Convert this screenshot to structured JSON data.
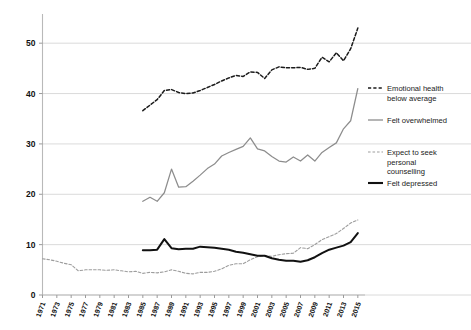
{
  "chart_data": {
    "type": "line",
    "title": "",
    "subtitle": "",
    "xlabel": "",
    "ylabel": "",
    "xlim": [
      1971,
      2016
    ],
    "ylim": [
      0,
      55
    ],
    "yticks": [
      0,
      10,
      20,
      30,
      40,
      50
    ],
    "grid": "horizontal",
    "legend_position": "right",
    "xticks": [
      1971,
      1973,
      1975,
      1977,
      1979,
      1981,
      1983,
      1985,
      1987,
      1989,
      1991,
      1993,
      1995,
      1997,
      1999,
      2001,
      2003,
      2005,
      2007,
      2009,
      2011,
      2013,
      2015
    ],
    "xtick_labels": [
      "1971",
      "1973",
      "1975",
      "1977",
      "1979",
      "1981",
      "1983",
      "1985",
      "1987",
      "1989",
      "1991",
      "1993",
      "1995",
      "1997",
      "1999",
      "2001",
      "2003",
      "2005",
      "2007",
      "2009",
      "2011",
      "2013",
      "2015"
    ],
    "ytick_labels": [
      "0",
      "10",
      "20",
      "30",
      "40",
      "50"
    ],
    "series": [
      {
        "name": "Emotional health below average",
        "key": "emotional",
        "color": "#1b1b1b",
        "style": "dashed",
        "x": [
          1985,
          1986,
          1987,
          1988,
          1989,
          1990,
          1991,
          1992,
          1993,
          1994,
          1995,
          1996,
          1997,
          1998,
          1999,
          2000,
          2001,
          2002,
          2003,
          2004,
          2005,
          2006,
          2007,
          2008,
          2009,
          2010,
          2011,
          2012,
          2013,
          2014,
          2015
        ],
        "values": [
          36.6,
          37.7,
          38.8,
          40.6,
          40.8,
          40.2,
          40.0,
          40.1,
          40.6,
          41.2,
          41.8,
          42.5,
          43.1,
          43.6,
          43.4,
          44.3,
          44.2,
          43.0,
          44.7,
          45.3,
          45.1,
          45.1,
          45.2,
          44.8,
          45.0,
          47.2,
          46.3,
          48.1,
          46.5,
          48.9,
          53.0
        ]
      },
      {
        "name": "Felt overwhelmed",
        "key": "overwhelmed",
        "color": "#8d8d8d",
        "style": "solid",
        "x": [
          1985,
          1986,
          1987,
          1988,
          1989,
          1990,
          1991,
          1992,
          1993,
          1994,
          1995,
          1996,
          1997,
          1998,
          1999,
          2000,
          2001,
          2002,
          2003,
          2004,
          2005,
          2006,
          2007,
          2008,
          2009,
          2010,
          2011,
          2012,
          2013,
          2014,
          2015
        ],
        "values": [
          18.6,
          19.4,
          18.6,
          20.3,
          25.0,
          21.4,
          21.5,
          22.6,
          23.8,
          25.1,
          26.0,
          27.6,
          28.3,
          28.9,
          29.5,
          31.2,
          29.0,
          28.6,
          27.5,
          26.6,
          26.4,
          27.4,
          26.6,
          27.8,
          26.6,
          28.3,
          29.3,
          30.2,
          33.0,
          34.6,
          41.0
        ]
      },
      {
        "name": "Expect to seek personal counselling",
        "key": "counselling",
        "color": "#9d9d9d",
        "style": "dotted",
        "x": [
          1971,
          1972,
          1973,
          1974,
          1975,
          1976,
          1977,
          1978,
          1979,
          1980,
          1981,
          1982,
          1983,
          1984,
          1985,
          1986,
          1987,
          1988,
          1989,
          1990,
          1991,
          1992,
          1993,
          1994,
          1995,
          1996,
          1997,
          1998,
          1999,
          2000,
          2001,
          2002,
          2003,
          2004,
          2005,
          2006,
          2007,
          2008,
          2009,
          2010,
          2011,
          2012,
          2013,
          2014,
          2015
        ],
        "values": [
          7.2,
          7.0,
          6.7,
          6.3,
          6.0,
          4.8,
          5.0,
          5.0,
          5.0,
          4.9,
          5.0,
          4.8,
          4.6,
          4.7,
          4.3,
          4.5,
          4.4,
          4.6,
          5.0,
          4.7,
          4.3,
          4.2,
          4.5,
          4.5,
          4.7,
          5.2,
          5.9,
          6.2,
          6.2,
          7.0,
          7.6,
          7.8,
          7.7,
          8.0,
          8.2,
          8.3,
          9.4,
          9.2,
          10.0,
          11.0,
          11.6,
          12.2,
          13.2,
          14.3,
          14.9
        ]
      },
      {
        "name": "Felt depressed",
        "key": "depressed",
        "color": "#111111",
        "style": "solid-bold",
        "x": [
          1985,
          1986,
          1987,
          1988,
          1989,
          1990,
          1991,
          1992,
          1993,
          1994,
          1995,
          1996,
          1997,
          1998,
          1999,
          2000,
          2001,
          2002,
          2003,
          2004,
          2005,
          2006,
          2007,
          2008,
          2009,
          2010,
          2011,
          2012,
          2013,
          2014,
          2015
        ],
        "values": [
          8.9,
          8.9,
          9.0,
          11.1,
          9.3,
          9.1,
          9.2,
          9.2,
          9.6,
          9.5,
          9.4,
          9.2,
          9.0,
          8.6,
          8.4,
          8.1,
          7.8,
          7.8,
          7.3,
          7.0,
          6.8,
          6.8,
          6.6,
          6.9,
          7.5,
          8.3,
          9.0,
          9.4,
          9.8,
          10.5,
          12.3
        ]
      }
    ]
  },
  "legend": {
    "items": [
      {
        "label_line1": "Emotional health",
        "label_line2": "below average",
        "style": "dashed",
        "color": "#1b1b1b"
      },
      {
        "label_line1": "Felt overwhelmed",
        "label_line2": "",
        "style": "solid",
        "color": "#8d8d8d"
      },
      {
        "label_line1": "Expect to seek",
        "label_line2": "personal",
        "label_line3": "counselling",
        "style": "dotted",
        "color": "#9d9d9d"
      },
      {
        "label_line1": "Felt depressed",
        "label_line2": "",
        "style": "solid-bold",
        "color": "#111111"
      }
    ]
  }
}
